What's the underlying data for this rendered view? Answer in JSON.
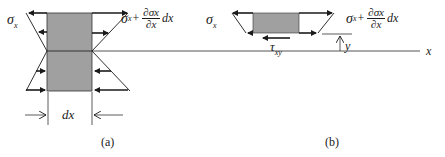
{
  "figure": {
    "panel_a": {
      "caption": "(a)",
      "left_stress_label": "σ",
      "left_stress_sub": "x",
      "right_stress_label_prefix": "σ",
      "right_stress_label_sub": "x",
      "right_stress_plus": "+",
      "right_frac_num": "∂σx",
      "right_frac_den": "∂x",
      "right_stress_suffix": "dx",
      "width_label": "dx"
    },
    "panel_b": {
      "caption": "(b)",
      "left_stress_label": "σ",
      "left_stress_sub": "x",
      "right_stress_label_prefix": "σ",
      "right_stress_label_sub": "x",
      "right_stress_plus": "+",
      "right_frac_num": "∂σx",
      "right_frac_den": "∂x",
      "right_stress_suffix": "dx",
      "shear_label": "τ",
      "shear_sub": "xy",
      "y_label": "y",
      "x_axis_label": "x"
    },
    "colors": {
      "element_fill": "#a0a0a0",
      "stroke": "#1a1a1a"
    }
  }
}
